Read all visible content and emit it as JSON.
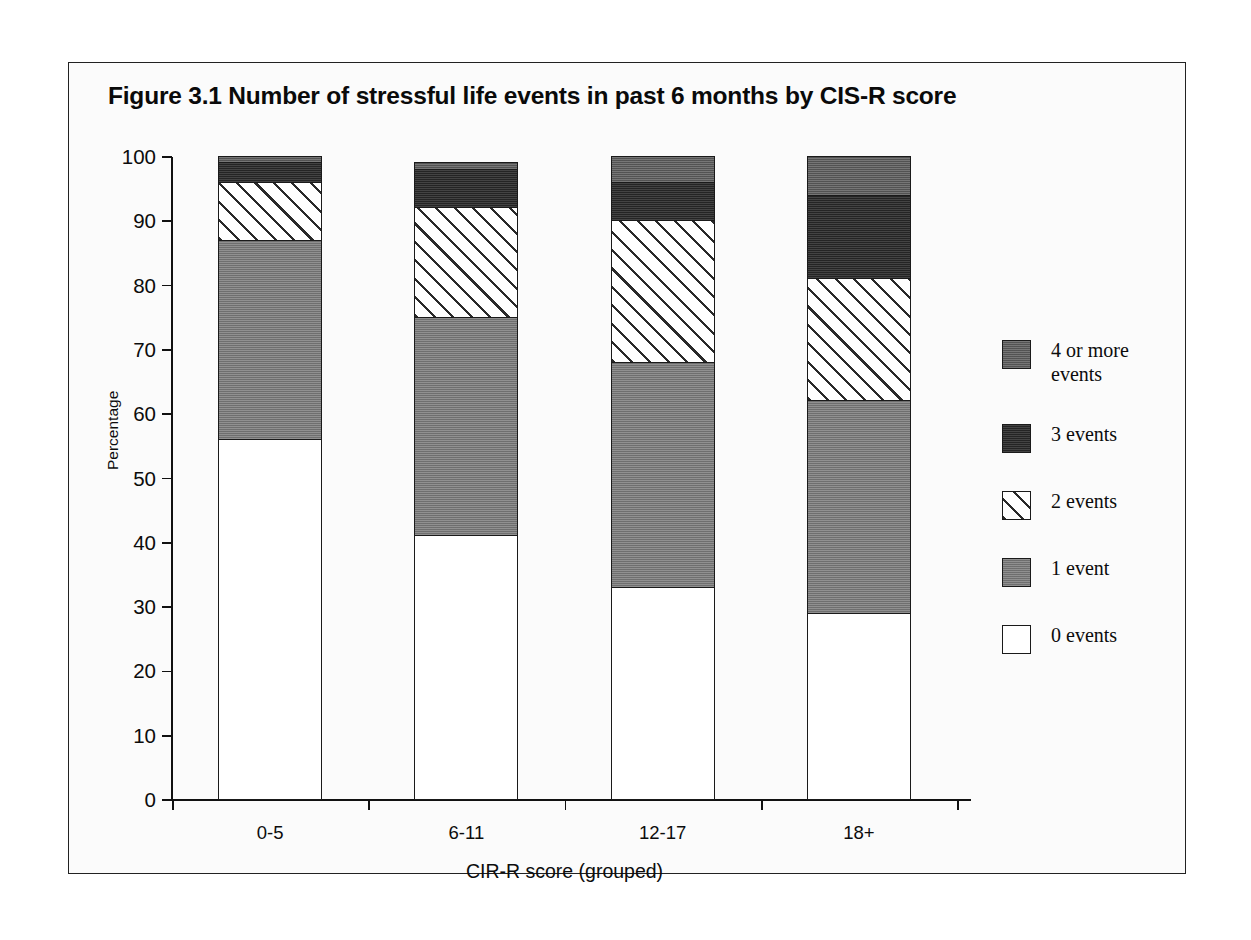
{
  "figure": {
    "title": "Figure 3.1   Number of stressful life events in past 6 months by CIS-R score"
  },
  "chart_data": {
    "type": "bar",
    "subtype": "stacked-percentage",
    "title": "Figure 3.1   Number of stressful life events in past 6 months by CIS-R score",
    "xlabel": "CIR-R score (grouped)",
    "ylabel": "Percentage",
    "ylim": [
      0,
      100
    ],
    "ytick_step": 10,
    "grid": false,
    "legend_position": "right",
    "categories": [
      "0-5",
      "6-11",
      "12-17",
      "18+"
    ],
    "ytick_labels": [
      "100",
      "90",
      "80",
      "70",
      "60",
      "50",
      "40",
      "30",
      "20",
      "10",
      "0"
    ],
    "series": [
      {
        "name": "0 events",
        "key": "s0",
        "values": [
          56,
          41,
          33,
          29
        ],
        "fill": "white",
        "color": "#ffffff"
      },
      {
        "name": "1 event",
        "key": "s1",
        "values": [
          31,
          34,
          35,
          33
        ],
        "fill": "solid-gray",
        "color": "#7b7b7b"
      },
      {
        "name": "2 events",
        "key": "s2",
        "values": [
          9,
          17,
          22,
          19
        ],
        "fill": "diagonal-hatch",
        "color": "#ffffff"
      },
      {
        "name": "3 events",
        "key": "s3",
        "values": [
          3,
          6,
          6,
          13
        ],
        "fill": "solid-dark",
        "color": "#2e2e2e"
      },
      {
        "name": "4 or more\nevents",
        "key": "s4",
        "values": [
          1,
          1,
          4,
          6
        ],
        "fill": "solid-midgray",
        "color": "#606060"
      }
    ],
    "stack_totals": [
      100,
      99,
      100,
      100
    ],
    "legend_order": [
      "4 or more\nevents",
      "3 events",
      "2 events",
      "1 event",
      "0 events"
    ]
  },
  "legend": {
    "items": [
      {
        "label": "4 or more\nevents",
        "key": "s4"
      },
      {
        "label": "3 events",
        "key": "s3"
      },
      {
        "label": "2 events",
        "key": "s2"
      },
      {
        "label": "1 event",
        "key": "s1"
      },
      {
        "label": "0 events",
        "key": "s0"
      }
    ]
  }
}
